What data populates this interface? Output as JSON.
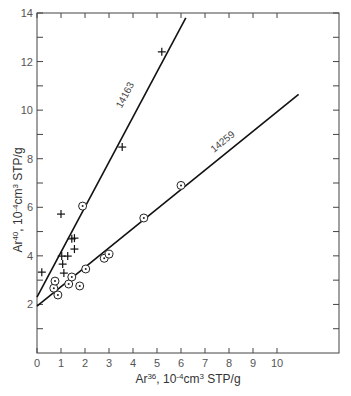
{
  "chart_data": {
    "type": "scatter",
    "title": "",
    "xlabel": "Ar36, 10^-4 cm3 STP/g",
    "ylabel": "Ar40, 10^-4 cm3 STP/g",
    "xlabel_parts": {
      "base": "Ar",
      "sup": "36",
      "rest": ", 10",
      "exp": "-4",
      "unit": "cm",
      "unit_sup": "3",
      "tail": " STP/g"
    },
    "ylabel_parts": {
      "base": "Ar",
      "sup": "40",
      "rest": ", 10",
      "exp": "-4",
      "unit": "cm",
      "unit_sup": "3",
      "tail": " STP/g"
    },
    "xlim": [
      0,
      12.6
    ],
    "ylim": [
      0,
      14
    ],
    "x_ticks": [
      0,
      1,
      2,
      3,
      4,
      5,
      6,
      7,
      8,
      9,
      10
    ],
    "y_ticks": [
      2,
      4,
      6,
      8,
      10,
      12,
      14
    ],
    "y_minor_ticks": [
      1,
      3,
      5,
      7,
      9,
      11,
      13
    ],
    "grid": false,
    "series": [
      {
        "name": "14163",
        "marker": "plus",
        "points": [
          {
            "x": 0.2,
            "y": 3.33
          },
          {
            "x": 1.0,
            "y": 5.72
          },
          {
            "x": 1.03,
            "y": 3.99
          },
          {
            "x": 1.07,
            "y": 3.66
          },
          {
            "x": 1.12,
            "y": 3.29
          },
          {
            "x": 1.28,
            "y": 3.99
          },
          {
            "x": 1.45,
            "y": 4.7
          },
          {
            "x": 1.56,
            "y": 4.73
          },
          {
            "x": 1.56,
            "y": 4.28
          },
          {
            "x": 3.55,
            "y": 8.48
          },
          {
            "x": 5.2,
            "y": 12.4
          }
        ],
        "fit_line": {
          "x0": 0,
          "y0": 2.3,
          "x1": 6.2,
          "y1": 13.8
        },
        "label_position": {
          "x": 3.9,
          "y": 10.5
        }
      },
      {
        "name": "14259",
        "marker": "circle-dot",
        "points": [
          {
            "x": 0.7,
            "y": 2.67
          },
          {
            "x": 0.75,
            "y": 2.96
          },
          {
            "x": 0.87,
            "y": 2.39
          },
          {
            "x": 1.32,
            "y": 2.84
          },
          {
            "x": 1.45,
            "y": 3.13
          },
          {
            "x": 1.78,
            "y": 2.76
          },
          {
            "x": 1.9,
            "y": 6.05
          },
          {
            "x": 2.03,
            "y": 3.46
          },
          {
            "x": 2.8,
            "y": 3.9
          },
          {
            "x": 3.0,
            "y": 4.07
          },
          {
            "x": 4.45,
            "y": 5.56
          },
          {
            "x": 6.0,
            "y": 6.9
          }
        ],
        "fit_line": {
          "x0": 0,
          "y0": 1.93,
          "x1": 10.9,
          "y1": 10.65
        },
        "label_position": {
          "x": 7.9,
          "y": 8.5
        }
      }
    ]
  }
}
